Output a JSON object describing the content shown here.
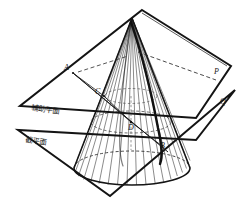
{
  "figure": {
    "background_color": "#ffffff",
    "line_color": "#1a1a1a"
  },
  "planes": {
    "auxiliary": {
      "label": "辅助平面",
      "corner_label": "P"
    },
    "cutting": {
      "label": "截平面",
      "corner_label": "Q"
    }
  },
  "points": {
    "a": "A",
    "b": "B",
    "c": "C",
    "d": "D"
  },
  "geometry": {
    "apex": [
      132,
      18
    ],
    "base_center": [
      132,
      168
    ],
    "base_rx": 58,
    "base_ry": 17,
    "ruling_count": 26,
    "section_curve": "parabola",
    "circle_section_center": [
      131,
      122
    ],
    "circle_section_rx": 40,
    "circle_section_ry": 11
  }
}
